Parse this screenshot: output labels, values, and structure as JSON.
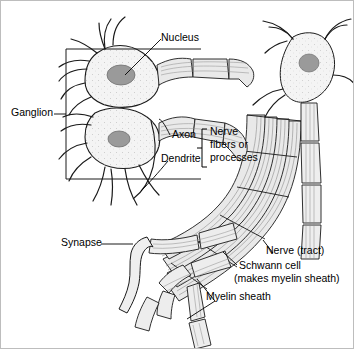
{
  "figure": {
    "background_color": "#ffffff",
    "line_color": "#1a1a1a",
    "cell_fill": "#f2f2f2",
    "nucleus_fill": "#9a9a9a",
    "fiber_fill": "#e8e8e8"
  },
  "labels": {
    "nucleus": "Nucleus",
    "ganglion": "Ganglion",
    "axon": "Axon",
    "dendrite": "Dendrite",
    "nerve_fibers_line1": "Nerve",
    "nerve_fibers_line2": "fibers or",
    "nerve_fibers_line3": "processes",
    "synapse": "Synapse",
    "nerve_tract": "Nerve (tract)",
    "schwann_line1": "Schwann cell",
    "schwann_line2": "(makes myelin sheath)",
    "myelin_sheath": "Myelin sheath"
  },
  "structures": {
    "cell_bodies": 3,
    "ganglion_box": {
      "x": 65,
      "y": 48,
      "width": 135,
      "height": 130
    },
    "nuclei": 3
  }
}
